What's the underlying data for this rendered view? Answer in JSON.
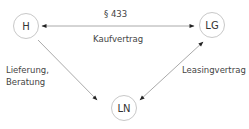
{
  "diagram": {
    "nodes": [
      {
        "id": "H",
        "label": "H"
      },
      {
        "id": "LG",
        "label": "LG"
      },
      {
        "id": "LN",
        "label": "LN"
      }
    ],
    "edges": [
      {
        "from": "H",
        "to": "LG",
        "label_top": "§ 433",
        "label_bottom": "Kaufvertrag",
        "bidirectional": true
      },
      {
        "from": "H",
        "to": "LN",
        "label_line1": "Lieferung,",
        "label_line2": "Beratung",
        "bidirectional": false
      },
      {
        "from": "LG",
        "to": "LN",
        "label": "Leasingvertrag",
        "bidirectional": true
      }
    ],
    "colors": {
      "line": "#999999",
      "arrowhead": "#222222",
      "node_border": "#c8c8c8",
      "text": "#444444"
    }
  }
}
